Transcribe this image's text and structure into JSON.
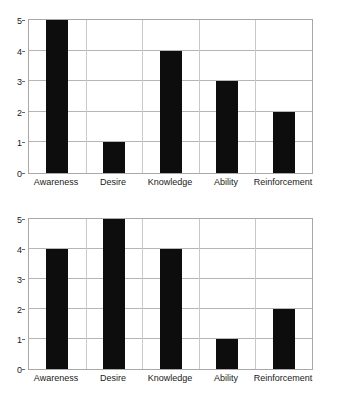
{
  "chart_data": [
    {
      "type": "bar",
      "title": "",
      "subtitle": "",
      "xlabel": "",
      "ylabel": "",
      "categories": [
        "Awareness",
        "Desire",
        "Knowledge",
        "Ability",
        "Reinforcement"
      ],
      "values": [
        5,
        1,
        4,
        3,
        2
      ],
      "ylim": [
        0,
        5
      ],
      "yticks": [
        0,
        1,
        2,
        3,
        4,
        5
      ],
      "ytick_labels": [
        "0",
        "1",
        "2",
        "3",
        "4",
        "5"
      ],
      "grid": true,
      "legend": false,
      "bar_color": "#0d0d0d",
      "grid_color": "#b5b5b5",
      "axis_color": "#a8a8a8",
      "background": "#ffffff"
    },
    {
      "type": "bar",
      "title": "",
      "subtitle": "",
      "xlabel": "",
      "ylabel": "",
      "categories": [
        "Awareness",
        "Desire",
        "Knowledge",
        "Ability",
        "Reinforcement"
      ],
      "values": [
        4,
        5,
        4,
        1,
        2
      ],
      "ylim": [
        0,
        5
      ],
      "yticks": [
        0,
        1,
        2,
        3,
        4,
        5
      ],
      "ytick_labels": [
        "0",
        "1",
        "2",
        "3",
        "4",
        "5"
      ],
      "grid": true,
      "legend": false,
      "bar_color": "#0d0d0d",
      "grid_color": "#b5b5b5",
      "axis_color": "#a8a8a8",
      "background": "#ffffff"
    }
  ]
}
